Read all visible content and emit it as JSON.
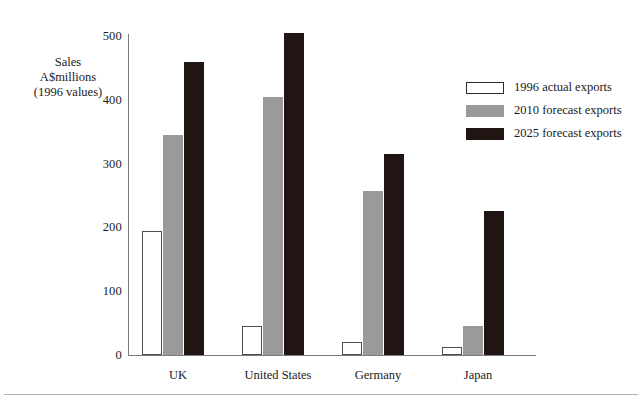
{
  "chart_data": {
    "type": "bar",
    "title": "",
    "subtitle": "",
    "xlabel": "",
    "ylabel": "Sales\nA$millions\n(1996 values)",
    "ylabel_lines": [
      "Sales",
      "A$millions",
      "(1996 values)"
    ],
    "categories": [
      "UK",
      "United States",
      "Germany",
      "Japan"
    ],
    "series": [
      {
        "name": "1996 actual exports",
        "color": "#ffffff",
        "values": [
          195,
          45,
          20,
          12
        ]
      },
      {
        "name": "2010 forecast exports",
        "color": "#9a9a9a",
        "values": [
          345,
          405,
          257,
          45
        ]
      },
      {
        "name": "2025 forecast exports",
        "color": "#211514",
        "values": [
          460,
          505,
          315,
          225
        ]
      }
    ],
    "ylim": [
      0,
      500
    ],
    "y_ticks": [
      0,
      100,
      200,
      300,
      400,
      500
    ],
    "y_tick_labels": [
      "0",
      "100",
      "200",
      "300",
      "400",
      "500"
    ],
    "grid": false,
    "legend_position": "right"
  },
  "legend": {
    "entries": [
      {
        "label": "1996 actual exports",
        "swatch": "white-swatch"
      },
      {
        "label": "2010 forecast exports",
        "swatch": "gray-swatch"
      },
      {
        "label": "2025 forecast exports",
        "swatch": "black-swatch"
      }
    ]
  }
}
